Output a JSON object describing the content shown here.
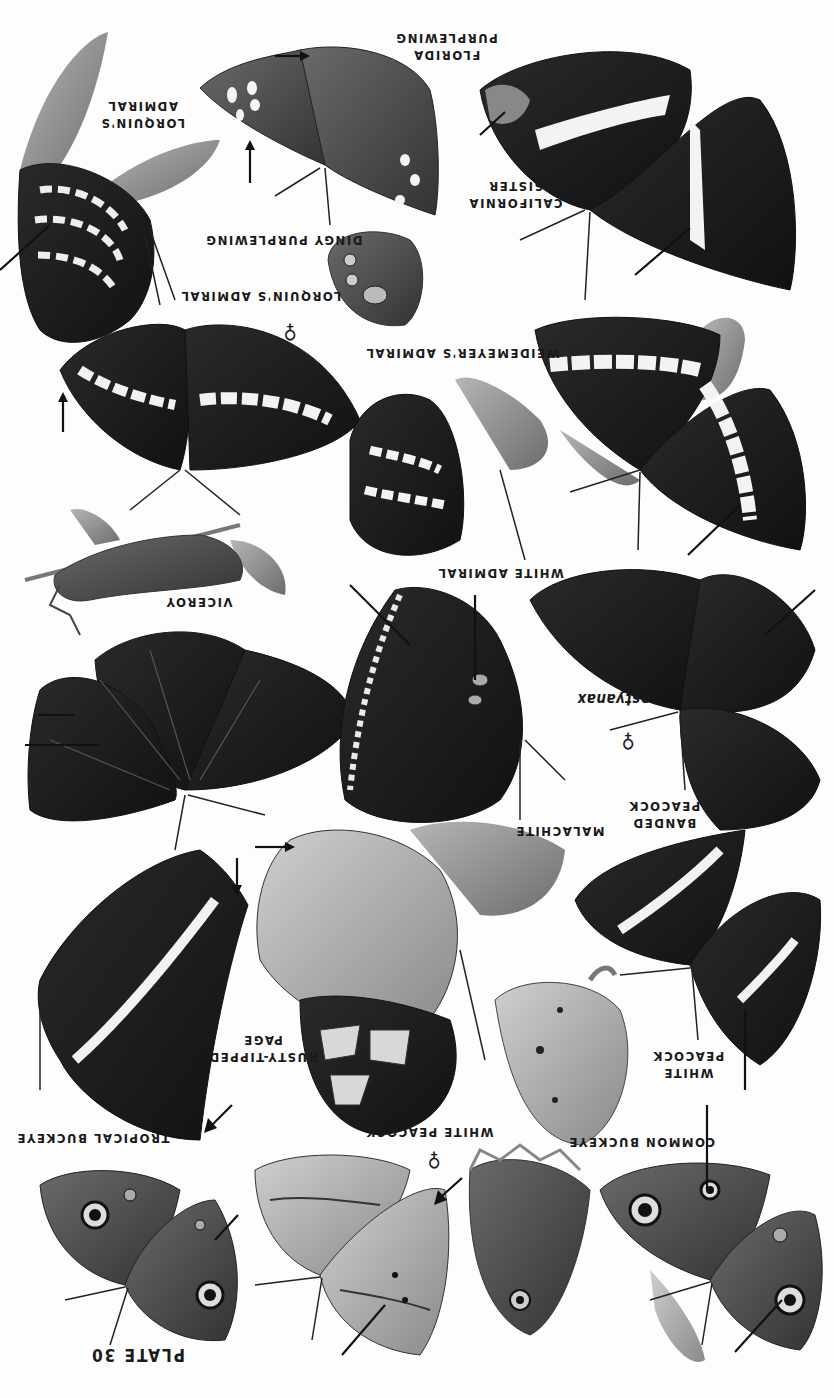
{
  "plate": {
    "title": "PLATE 30",
    "orientation": "rotated 180 degrees",
    "colors": {
      "background": "#fdfdfd",
      "ink": "#111111",
      "wing_dark": "#1e1e1e",
      "wing_mid": "#4a4a4a",
      "wing_light": "#9a9a9a",
      "band": "#f2f2f2",
      "leaf": "#8c8c8c"
    }
  },
  "labels": [
    {
      "id": "lorquins-admiral-top",
      "lines": [
        "LORQUIN'S",
        "ADMIRAL"
      ]
    },
    {
      "id": "florida-purplewing",
      "lines": [
        "FLORIDA",
        "PURPLEWING"
      ]
    },
    {
      "id": "dingy-purplewing",
      "lines": [
        "DINGY PURPLEWING"
      ]
    },
    {
      "id": "california-sister",
      "lines": [
        "CALIFORNIA",
        "SISTER"
      ]
    },
    {
      "id": "lorquins-admiral",
      "lines": [
        "LORQUIN'S ADMIRAL"
      ]
    },
    {
      "id": "weidemeyers-admiral",
      "lines": [
        "WEIDEMEYER'S ADMIRAL"
      ]
    },
    {
      "id": "white-admiral",
      "lines": [
        "WHITE ADMIRAL"
      ]
    },
    {
      "id": "viceroy",
      "lines": [
        "VICEROY"
      ]
    },
    {
      "id": "astyanax",
      "lines": [
        "astyanax"
      ]
    },
    {
      "id": "malachite",
      "lines": [
        "MALACHITE"
      ]
    },
    {
      "id": "banded-peacock",
      "lines": [
        "BANDED",
        "PEACOCK"
      ]
    },
    {
      "id": "rusty-tipped-page",
      "lines": [
        "RUSTY-TIPPED",
        "PAGE"
      ]
    },
    {
      "id": "white-peacock-right",
      "lines": [
        "WHITE",
        "PEACOCK"
      ]
    },
    {
      "id": "tropical-buckeye",
      "lines": [
        "TROPICAL BUCKEYE"
      ]
    },
    {
      "id": "white-peacock",
      "lines": [
        "WHITE PEACOCK"
      ]
    },
    {
      "id": "common-buckeye",
      "lines": [
        "COMMON BUCKEYE"
      ]
    }
  ],
  "symbols": {
    "female": "♀"
  }
}
